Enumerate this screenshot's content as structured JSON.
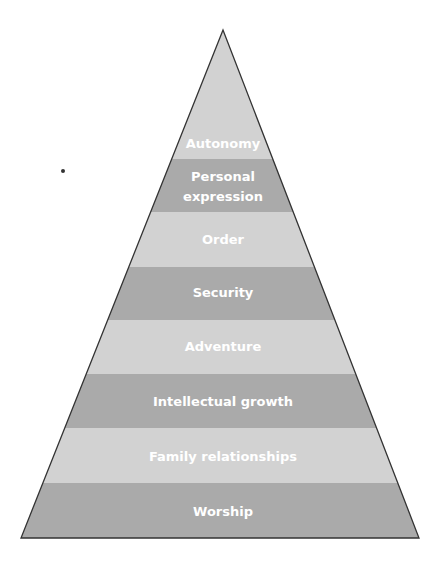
{
  "diagram": {
    "type": "pyramid",
    "colors": {
      "outline": "#333333",
      "band_light": "#d2d2d2",
      "band_dark": "#aaaaaa",
      "label": "#ffffff"
    },
    "levels_top_to_bottom": [
      {
        "label": "Autonomy",
        "shade": "light"
      },
      {
        "label": "Personal expression",
        "lines": [
          "Personal",
          "expression"
        ],
        "shade": "dark"
      },
      {
        "label": "Order",
        "shade": "light"
      },
      {
        "label": "Security",
        "shade": "dark"
      },
      {
        "label": "Adventure",
        "shade": "light"
      },
      {
        "label": "Intellectual growth",
        "shade": "dark"
      },
      {
        "label": "Family relationships",
        "shade": "light"
      },
      {
        "label": "Worship",
        "shade": "dark"
      }
    ]
  },
  "labels": {
    "l0": "Autonomy",
    "l1a": "Personal",
    "l1b": "expression",
    "l2": "Order",
    "l3": "Security",
    "l4": "Adventure",
    "l5": "Intellectual growth",
    "l6": "Family relationships",
    "l7": "Worship"
  }
}
